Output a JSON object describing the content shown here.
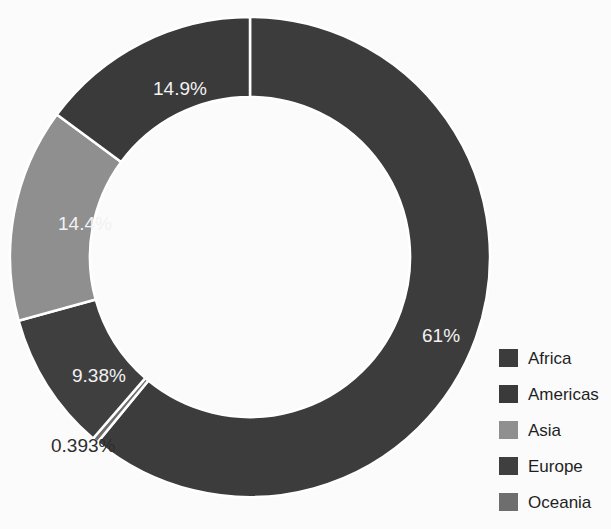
{
  "chart_data": {
    "type": "pie",
    "variant": "donut",
    "title": "",
    "xlabel": "",
    "ylabel": "",
    "legend_position": "right",
    "grid": false,
    "start_angle_deg": 0,
    "direction": "clockwise",
    "inner_radius_ratio": 0.667,
    "categories": [
      "Africa",
      "Americas",
      "Asia",
      "Europe",
      "Oceania"
    ],
    "values": [
      61,
      14.9,
      14.4,
      9.38,
      0.393
    ],
    "slices": [
      {
        "label": "Africa",
        "value": 61,
        "display": "61%",
        "color": "#3c3c3c",
        "label_color": "#f2f2f2",
        "label_position": "inside"
      },
      {
        "label": "Oceania",
        "value": 0.393,
        "display": "0.393%",
        "color": "#6e6e6e",
        "label_color": "#2e2e2e",
        "label_position": "outside"
      },
      {
        "label": "Europe",
        "value": 9.38,
        "display": "9.38%",
        "color": "#3f3f3f",
        "label_color": "#f2f2f2",
        "label_position": "inside"
      },
      {
        "label": "Asia",
        "value": 14.4,
        "display": "14.4%",
        "color": "#8f8f8f",
        "label_color": "#f7f7f7",
        "label_position": "inside"
      },
      {
        "label": "Americas",
        "value": 14.9,
        "display": "14.9%",
        "color": "#3a3a3a",
        "label_color": "#f2f2f2",
        "label_position": "inside"
      }
    ],
    "data_labels": [
      {
        "text": "14.9%",
        "x": 153,
        "y": 95
      },
      {
        "text": "14.4%",
        "x": 58,
        "y": 230
      },
      {
        "text": "9.38%",
        "x": 72,
        "y": 382
      },
      {
        "text": "0.393%",
        "x": 51,
        "y": 452
      },
      {
        "text": "61%",
        "x": 422,
        "y": 342
      }
    ],
    "separator_color": "#ffffff"
  },
  "legend": {
    "items": [
      {
        "label": "Africa",
        "color": "#3c3c3c"
      },
      {
        "label": "Americas",
        "color": "#3a3a3a"
      },
      {
        "label": "Asia",
        "color": "#8f8f8f"
      },
      {
        "label": "Europe",
        "color": "#3f3f3f"
      },
      {
        "label": "Oceania",
        "color": "#6e6e6e"
      }
    ]
  }
}
